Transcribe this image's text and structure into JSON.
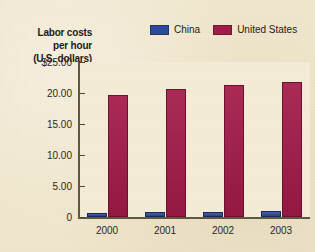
{
  "chart_data": {
    "type": "bar",
    "title": "",
    "xlabel": "",
    "ylabel": "Labor costs per hour (U.S. dollars)",
    "ylabel_lines": [
      "Labor costs",
      "per hour",
      "(U.S. dollars)"
    ],
    "categories": [
      "2000",
      "2001",
      "2002",
      "2003"
    ],
    "series": [
      {
        "name": "China",
        "color": "#2b4a9b",
        "values": [
          0.65,
          0.75,
          0.85,
          1.05
        ]
      },
      {
        "name": "United States",
        "color": "#a41a4a",
        "values": [
          19.6,
          20.6,
          21.3,
          21.8
        ]
      }
    ],
    "ylim": [
      0,
      25
    ],
    "y_ticks": [
      {
        "value": 25,
        "label": "$25.00"
      },
      {
        "value": 20,
        "label": "20.00"
      },
      {
        "value": 15,
        "label": "15.00"
      },
      {
        "value": 10,
        "label": "10.00"
      },
      {
        "value": 5,
        "label": "5.00"
      },
      {
        "value": 0,
        "label": "0"
      }
    ],
    "grid": false,
    "legend_position": "top"
  },
  "legend": {
    "entries": [
      {
        "label": "China",
        "color": "#2b4a9b"
      },
      {
        "label": "United States",
        "color": "#a41a4a"
      }
    ]
  },
  "colors": {
    "background": "#f0e6cd",
    "plot_background": "#f4ecd6",
    "axis": "#5d5743",
    "text": "#1d1a14",
    "china": "#2b4a9b",
    "united_states": "#a41a4a"
  }
}
